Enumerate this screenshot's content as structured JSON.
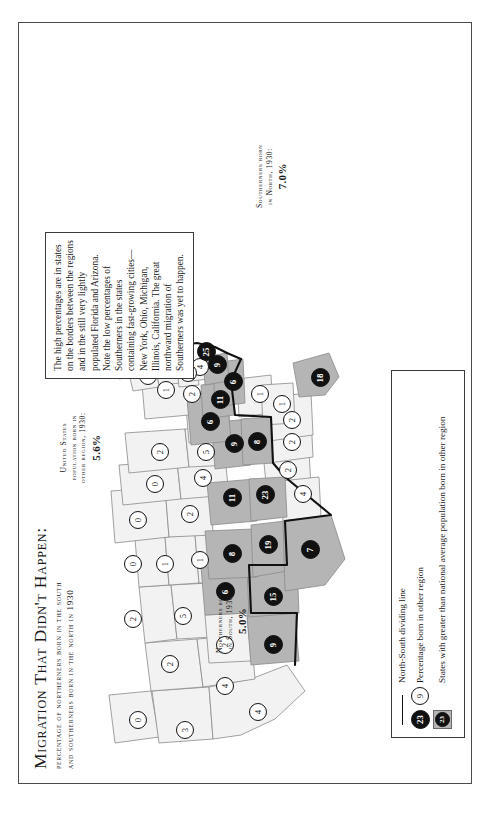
{
  "title": {
    "main": "Migration That Didn't Happen:",
    "sub1": "percentage of northerners born in the south",
    "sub2": "and southerners born in the north in 1930"
  },
  "stats": {
    "us": {
      "label1": "United States",
      "label2": "population born in",
      "label3": "other region, 1930:",
      "value": "5.6%"
    },
    "north": {
      "label1": "Northerners born",
      "label2": "in South, 1930:",
      "value": "5.0%"
    },
    "south": {
      "label1": "Southerners born",
      "label2": "in North, 1930:",
      "value": "7.0%"
    }
  },
  "note": "The high percentages are in states on the borders between the regions and in the still very lightly populated Florida and Arizona. Note the low percentages of Southerners in the states containing fast-growing cities—New York, Ohio, Michigan, Illinois, California. The great northward migration of Southerners was yet to happen.",
  "legend": {
    "items": [
      {
        "symbol": "line",
        "text": "North-South dividing line"
      },
      {
        "symbol": "circles",
        "sample_low": "9",
        "sample_high": "23",
        "text": "Percentage born in other region"
      },
      {
        "symbol": "swatch",
        "sample": "23",
        "text": "States with greater than national average population born in other region"
      }
    ]
  },
  "colors": {
    "high_fill": "#b5b5b5",
    "low_fill": "#f2f2f2",
    "marker_high_bg": "#111111",
    "marker_low_bg": "#ffffff",
    "outline": "#8a8a8a",
    "divider": "#111111",
    "frame": "#4a4a4a"
  },
  "chart_data": {
    "type": "map",
    "title": "Migration That Didn't Happen: percentage of northerners born in the south and southerners born in the north in 1930",
    "unit": "percent",
    "national_average": 5.6,
    "legend_threshold_note": "States shaded dark have greater than national average population born in other region",
    "states": [
      {
        "name": "Washington",
        "value": 0,
        "high": false,
        "x": 62,
        "y": 118
      },
      {
        "name": "Oregon",
        "value": 3,
        "high": false,
        "x": 52,
        "y": 165
      },
      {
        "name": "California",
        "value": 4,
        "high": false,
        "x": 70,
        "y": 238
      },
      {
        "name": "Idaho",
        "value": 2,
        "high": false,
        "x": 118,
        "y": 150
      },
      {
        "name": "Nevada",
        "value": 4,
        "high": false,
        "x": 96,
        "y": 205
      },
      {
        "name": "Montana",
        "value": 2,
        "high": false,
        "x": 163,
        "y": 113
      },
      {
        "name": "Wyoming",
        "value": 5,
        "high": false,
        "x": 166,
        "y": 163
      },
      {
        "name": "Utah",
        "value": 2,
        "high": false,
        "x": 137,
        "y": 205
      },
      {
        "name": "Arizona",
        "value": 9,
        "high": true,
        "x": 137,
        "y": 253
      },
      {
        "name": "Colorado",
        "value": 6,
        "high": true,
        "x": 190,
        "y": 205
      },
      {
        "name": "New Mexico",
        "value": 15,
        "high": true,
        "x": 185,
        "y": 253
      },
      {
        "name": "North Dakota",
        "value": 0,
        "high": false,
        "x": 218,
        "y": 113
      },
      {
        "name": "South Dakota",
        "value": 1,
        "high": false,
        "x": 218,
        "y": 145
      },
      {
        "name": "Nebraska",
        "value": 1,
        "high": false,
        "x": 222,
        "y": 180
      },
      {
        "name": "Kansas",
        "value": 8,
        "high": true,
        "x": 228,
        "y": 212
      },
      {
        "name": "Oklahoma",
        "value": 19,
        "high": true,
        "x": 237,
        "y": 248
      },
      {
        "name": "Texas",
        "value": 7,
        "high": true,
        "x": 232,
        "y": 290
      },
      {
        "name": "Minnesota",
        "value": 0,
        "high": false,
        "x": 262,
        "y": 118
      },
      {
        "name": "Iowa",
        "value": 2,
        "high": false,
        "x": 268,
        "y": 170
      },
      {
        "name": "Missouri",
        "value": 11,
        "high": true,
        "x": 284,
        "y": 212
      },
      {
        "name": "Arkansas",
        "value": 23,
        "high": true,
        "x": 287,
        "y": 245
      },
      {
        "name": "Louisiana",
        "value": 4,
        "high": false,
        "x": 288,
        "y": 283
      },
      {
        "name": "Wisconsin",
        "value": 0,
        "high": false,
        "x": 298,
        "y": 135
      },
      {
        "name": "Illinois",
        "value": 4,
        "high": false,
        "x": 304,
        "y": 183
      },
      {
        "name": "Michigan",
        "value": 2,
        "high": false,
        "x": 330,
        "y": 140
      },
      {
        "name": "Indiana",
        "value": 5,
        "high": false,
        "x": 330,
        "y": 186
      },
      {
        "name": "Kentucky",
        "value": 9,
        "high": true,
        "x": 338,
        "y": 214
      },
      {
        "name": "Tennessee",
        "value": 8,
        "high": true,
        "x": 340,
        "y": 237
      },
      {
        "name": "Mississippi",
        "value": 2,
        "high": false,
        "x": 312,
        "y": 268
      },
      {
        "name": "Alabama",
        "value": 2,
        "high": false,
        "x": 340,
        "y": 272
      },
      {
        "name": "Ohio",
        "value": 6,
        "high": true,
        "x": 360,
        "y": 190
      },
      {
        "name": "West Virginia",
        "value": 11,
        "high": true,
        "x": 382,
        "y": 200
      },
      {
        "name": "Virginia",
        "value": 6,
        "high": true,
        "x": 400,
        "y": 213
      },
      {
        "name": "North Carolina",
        "value": 1,
        "high": false,
        "x": 388,
        "y": 240
      },
      {
        "name": "South Carolina",
        "value": 1,
        "high": false,
        "x": 378,
        "y": 262
      },
      {
        "name": "Georgia",
        "value": 2,
        "high": false,
        "x": 362,
        "y": 272
      },
      {
        "name": "Florida",
        "value": 18,
        "high": true,
        "x": 404,
        "y": 300
      },
      {
        "name": "Pennsylvania",
        "value": 2,
        "high": false,
        "x": 388,
        "y": 172
      },
      {
        "name": "New York",
        "value": 1,
        "high": false,
        "x": 392,
        "y": 146
      },
      {
        "name": "Maryland",
        "value": 9,
        "high": true,
        "x": 417,
        "y": 197
      },
      {
        "name": "Delaware",
        "value": 4,
        "high": false,
        "x": 415,
        "y": 180
      },
      {
        "name": "New Jersey",
        "value": 2,
        "high": false,
        "x": 409,
        "y": 168
      },
      {
        "name": "Vermont",
        "value": 0,
        "high": false,
        "x": 406,
        "y": 128
      },
      {
        "name": "New Hampshire",
        "value": 0,
        "high": false,
        "x": 414,
        "y": 129
      },
      {
        "name": "Maine",
        "value": 0,
        "high": false,
        "x": 420,
        "y": 113
      },
      {
        "name": "Massachusetts",
        "value": 1,
        "high": false,
        "x": 424,
        "y": 142
      },
      {
        "name": "Connecticut",
        "value": 1,
        "high": false,
        "x": 418,
        "y": 152
      },
      {
        "name": "Rhode Island",
        "value": 1,
        "high": false,
        "x": 430,
        "y": 152
      },
      {
        "name": "District of Columbia",
        "value": 25,
        "high": true,
        "x": 430,
        "y": 186
      }
    ]
  }
}
